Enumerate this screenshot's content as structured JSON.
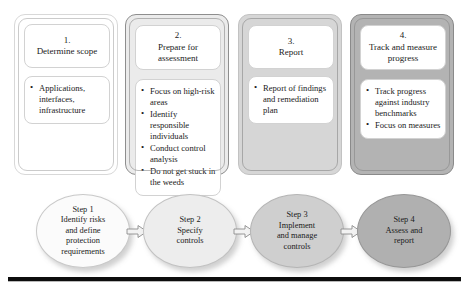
{
  "diagram": {
    "stages": [
      {
        "number": "1.",
        "title": "Determine scope",
        "bullets": [
          "Applications, interfaces, infrastructure"
        ],
        "fill": "#ffffff"
      },
      {
        "number": "2.",
        "title": "Prepare for assessment",
        "bullets": [
          "Focus on high-risk areas",
          "Identify responsible individuals",
          "Conduct control analysis",
          "Do not get stuck in the weeds"
        ],
        "fill": "#ebebeb"
      },
      {
        "number": "3.",
        "title": "Report",
        "bullets": [
          "Report of findings and remediation plan"
        ],
        "fill": "#d6d6d6"
      },
      {
        "number": "4.",
        "title": "Track and measure progress",
        "bullets": [
          "Track progress against industry benchmarks",
          "Focus on measures"
        ],
        "fill": "#b3b3b3"
      }
    ],
    "flow": {
      "steps": [
        {
          "label": "Step 1",
          "lines": [
            "Step 1",
            "Identify risks",
            "and define",
            "protection",
            "requirements"
          ],
          "fill": "#fbfbfb"
        },
        {
          "label": "Step 2",
          "lines": [
            "Step 2",
            "Specify",
            "controls"
          ],
          "fill": "#ededed"
        },
        {
          "label": "Step 3",
          "lines": [
            "Step 3",
            "Implement",
            "and manage",
            "controls"
          ],
          "fill": "#cfcfcf"
        },
        {
          "label": "Step 4",
          "lines": [
            "Step 4",
            "Assess and",
            "report"
          ],
          "fill": "#b0b0b0"
        }
      ],
      "connector_icon": "right-arrow-icon"
    },
    "rule_color": "#0d0d0d"
  }
}
